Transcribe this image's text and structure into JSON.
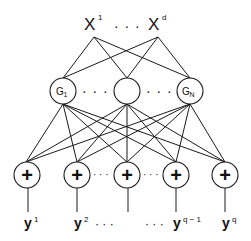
{
  "diagram": {
    "inputs": [
      {
        "label": "X",
        "sup": "1"
      },
      {
        "label": "X",
        "sup": "d"
      }
    ],
    "input_ellipsis": "· · ·",
    "hidden": [
      {
        "label": "G",
        "sub": "1"
      },
      {
        "label": "",
        "sub": ""
      },
      {
        "label": "G",
        "sub": "N"
      }
    ],
    "hidden_ellipsis": "· · ·",
    "sum_symbol": "+",
    "outputs": [
      {
        "label": "y",
        "sup": "1"
      },
      {
        "label": "y",
        "sup": "2"
      },
      {
        "label": "",
        "sup": ""
      },
      {
        "label": "y",
        "sup": "q − 1"
      },
      {
        "label": "y",
        "sup": "q"
      }
    ],
    "output_ellipsis": "· · ·",
    "sum_ellipsis": "· · ·"
  }
}
